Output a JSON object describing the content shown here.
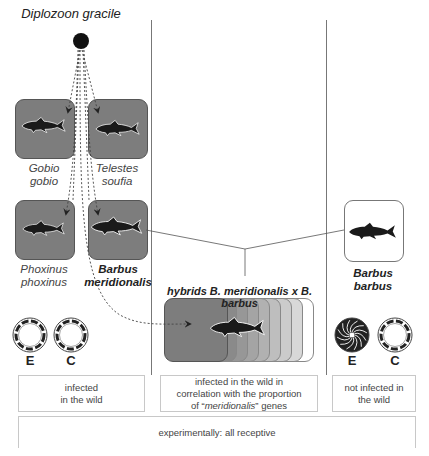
{
  "parasite": {
    "name": "Diplozoon gracile"
  },
  "hosts": [
    {
      "id": "gobio",
      "genus": "Gobio",
      "species": "gobio",
      "style": "dark",
      "bold": false
    },
    {
      "id": "telestes",
      "genus": "Telestes",
      "species": "soufia",
      "style": "dark",
      "bold": false
    },
    {
      "id": "phoxinus",
      "genus": "Phoxinus",
      "species": "phoxinus",
      "style": "dark",
      "bold": false
    },
    {
      "id": "barbus-meridionalis",
      "genus": "Barbus",
      "species": "meridionalis",
      "style": "dark",
      "bold": true
    },
    {
      "id": "barbus-barbus",
      "genus": "Barbus",
      "species": "barbus",
      "style": "light",
      "bold": true
    }
  ],
  "hybrids": {
    "title": "hybrids B. meridionalis x B. barbus",
    "gradient_colors": [
      "#7d7d7d",
      "#8a8a8a",
      "#979797",
      "#a4a4a4",
      "#b1b1b1",
      "#bebebe",
      "#cbcbcb",
      "#d8d8d8",
      "#ffffff"
    ]
  },
  "gill_types": {
    "left": {
      "e_label": "E",
      "c_label": "C",
      "e_type": "dashed-ring",
      "c_type": "dashed-ring"
    },
    "right": {
      "e_label": "E",
      "c_label": "C",
      "e_type": "spiral-filled",
      "c_type": "dashed-ring"
    }
  },
  "status": {
    "left_line1": "infected",
    "left_line2": "in the wild",
    "middle_line1": "infected in the wild in",
    "middle_line2": "correlation with the proportion",
    "middle_line3_pre": "of “",
    "middle_line3_em": "meridionalis",
    "middle_line3_post": "” genes",
    "right_line1": "not infected in",
    "right_line2": "the wild",
    "bottom": "experimentally: all receptive"
  },
  "colors": {
    "host_dark": "#7d7d7d",
    "fish": "#1a1a1a",
    "parasite_dot": "#111111",
    "divider": "#777777"
  }
}
